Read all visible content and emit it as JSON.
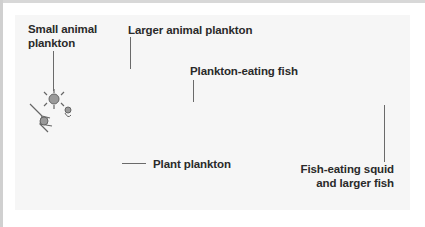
{
  "diagram": {
    "type": "marine food chain",
    "labels": {
      "small_animal_plankton": "Small animal\nplankton",
      "small_animal_plankton_line1": "Small animal",
      "small_animal_plankton_line2": "plankton",
      "larger_animal_plankton": "Larger animal plankton",
      "plankton_eating_fish": "Plankton-eating fish",
      "plant_plankton": "Plant plankton",
      "fish_eating_squid_line1": "Fish-eating squid",
      "fish_eating_squid_line2": "and larger fish"
    },
    "flow": [
      "Plant plankton",
      "Small animal plankton",
      "Larger animal plankton",
      "Plankton-eating fish",
      "Fish-eating squid and larger fish"
    ],
    "colors": {
      "arrow": "#7a7a7a",
      "text": "#2a2a2a",
      "panel": "#f6f6f6"
    }
  }
}
